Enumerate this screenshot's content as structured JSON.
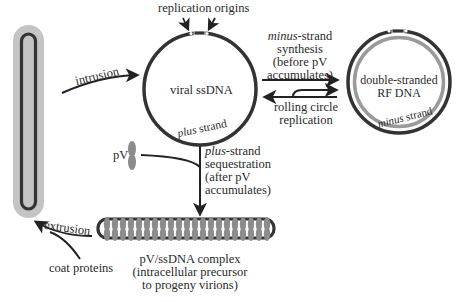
{
  "diagram": {
    "colors": {
      "strand_dark": "#333333",
      "coat_grey": "#c4c4c4",
      "minus_strand_grey": "#9a9a9a",
      "pv_grey": "#8c8c8c",
      "text": "#2a2a2a",
      "background": "#ffffff"
    },
    "labels": {
      "replication_origins": "replication origins",
      "viral_ssdna": "viral ssDNA",
      "plus_strand_italic": "plus",
      "plus_strand_rest": " strand",
      "intrusion": "intrusion",
      "minus_synthesis": {
        "line1_italic": "minus",
        "line1_rest": "-strand",
        "line2": "synthesis",
        "line3": "(before pV",
        "line4": "accumulates)"
      },
      "rolling_circle": {
        "line1": "rolling circle",
        "line2": "replication"
      },
      "rf_dna": {
        "line1": "double-stranded",
        "line2": "RF DNA"
      },
      "minus_strand_italic": "minus",
      "minus_strand_rest": " strand",
      "pv": "pV",
      "plus_sequestration": {
        "line1_italic": "plus",
        "line1_rest": "-strand",
        "line2": "sequestration",
        "line3": "(after pV",
        "line4": "accumulates)"
      },
      "complex": {
        "line1": "pV/ssDNA complex",
        "line2": "(intracellular precursor",
        "line3": "to progeny virions)"
      },
      "extrusion": "extrusion",
      "coat_proteins": "coat proteins"
    }
  }
}
